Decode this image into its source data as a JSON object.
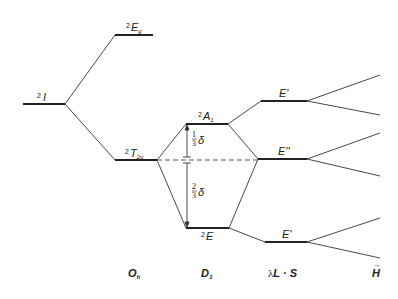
{
  "diagram": {
    "levels": {
      "free_ion": {
        "label_sup": "2",
        "label": "I"
      },
      "oh_upper": {
        "label_sup": "2",
        "label": "E",
        "label_sub": "g"
      },
      "oh_lower": {
        "label_sup": "2",
        "label": "T",
        "label_sub": "2g"
      },
      "d3_upper": {
        "label_sup": "2",
        "label": "A",
        "label_sub": "1"
      },
      "d3_lower": {
        "label_sup": "2",
        "label": "E"
      },
      "so_top": {
        "label": "E'"
      },
      "so_mid": {
        "label": "E''"
      },
      "so_bottom": {
        "label": "E'"
      }
    },
    "splitting": {
      "upper_fraction_num": "1",
      "upper_fraction_den": "3",
      "upper_symbol": "δ",
      "lower_fraction_num": "2",
      "lower_fraction_den": "3",
      "lower_symbol": "δ"
    },
    "columns": {
      "oh": {
        "label": "O",
        "sub": "h"
      },
      "d3": {
        "label": "D",
        "sub": "3"
      },
      "so": {
        "prefix": "λ",
        "label": "L · S"
      },
      "field": {
        "label": "H",
        "arrow": "→"
      }
    },
    "colors": {
      "line": "#222222",
      "dashed": "#444444"
    }
  }
}
